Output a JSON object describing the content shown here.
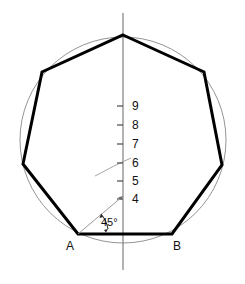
{
  "figure": {
    "type": "geometric-construction",
    "width": 245,
    "height": 284,
    "background_color": "#ffffff"
  },
  "colors": {
    "polygon_stroke": "#000000",
    "circle_stroke": "#888888",
    "axis_stroke": "#808080",
    "construction_stroke": "#9a9a9a",
    "text": "#111111"
  },
  "circle": {
    "name": "circumscribed-circle",
    "center_x": 123,
    "center_y": 140,
    "radius": 103,
    "stroke_width": 0.9
  },
  "axis": {
    "name": "vertical-center-line",
    "x": 123,
    "y_top": 13,
    "y_bottom": 270,
    "stroke_width": 1.2
  },
  "polygon": {
    "name": "heptagon",
    "sides": 7,
    "stroke_width": 3,
    "points": "123,35 204,72 222,165 172,234 78,234 23,164 42,72",
    "vertices": [
      {
        "label": "",
        "x": 123,
        "y": 35
      },
      {
        "label": "",
        "x": 204,
        "y": 72
      },
      {
        "label": "",
        "x": 222,
        "y": 165
      },
      {
        "label": "B",
        "x": 172,
        "y": 234
      },
      {
        "label": "A",
        "x": 78,
        "y": 234
      },
      {
        "label": "",
        "x": 23,
        "y": 164
      },
      {
        "label": "",
        "x": 42,
        "y": 72
      }
    ]
  },
  "vertex_labels": [
    {
      "name": "vertex-label-a",
      "text": "A",
      "x": 70,
      "y": 250
    },
    {
      "name": "vertex-label-b",
      "text": "B",
      "x": 177,
      "y": 250
    }
  ],
  "scale": {
    "name": "division-scale",
    "axis_x": 123,
    "tick_length": 6,
    "label_offset_x": 9,
    "ticks": [
      {
        "value": "9",
        "y": 106
      },
      {
        "value": "8",
        "y": 125
      },
      {
        "value": "7",
        "y": 144
      },
      {
        "value": "6",
        "y": 163
      },
      {
        "value": "5",
        "y": 181
      },
      {
        "value": "4",
        "y": 199
      }
    ]
  },
  "angle": {
    "name": "angle-45",
    "label": "45°",
    "label_x": 101,
    "label_y": 226,
    "vertex_x": 78,
    "vertex_y": 234,
    "ray_end_x": 123,
    "ray_end_y": 196,
    "arc_path": "M 108 229 A 32 32 0 0 0 101 214",
    "baseline_end_x": 140,
    "baseline_end_y": 234
  },
  "construction_arc": {
    "name": "construction-arc",
    "path": "M 95 176 C 103 172 113 166 131 158",
    "stroke_width": 0.9
  }
}
